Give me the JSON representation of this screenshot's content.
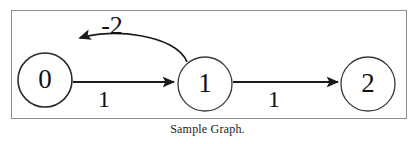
{
  "figure": {
    "caption": "Sample Graph.",
    "frame_color": "#8e8e8e",
    "stroke_color": "#1a1a1a",
    "background": "#ffffff"
  },
  "graph": {
    "type": "directed-weighted-graph",
    "nodes": [
      {
        "id": "node-0",
        "label": "0",
        "cx": 45,
        "cy": 80,
        "r": 27
      },
      {
        "id": "node-1",
        "label": "1",
        "cx": 205,
        "cy": 84,
        "r": 27
      },
      {
        "id": "node-2",
        "label": "2",
        "cx": 368,
        "cy": 84,
        "r": 27
      }
    ],
    "edges": [
      {
        "id": "edge-0-1",
        "from": "0",
        "to": "1",
        "weight": "1",
        "shape": "straight"
      },
      {
        "id": "edge-1-2",
        "from": "1",
        "to": "2",
        "weight": "1",
        "shape": "straight"
      },
      {
        "id": "edge-1-0",
        "from": "1",
        "to": "0",
        "weight": "-2",
        "shape": "curved"
      }
    ]
  }
}
